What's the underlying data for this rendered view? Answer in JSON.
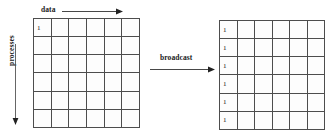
{
  "figure": {
    "axis_labels": {
      "horizontal": "data",
      "vertical": "processes"
    },
    "operation_label": "broadcast",
    "line_color": "#4d4d4d",
    "text_color": "#1a1a1a",
    "background": "#ffffff"
  },
  "chart_data": {
    "type": "table",
    "title": "broadcast",
    "xlabel": "data",
    "ylabel": "processes",
    "grids": [
      {
        "name": "source-grid",
        "rows": 6,
        "cols": 6,
        "cells": [
          [
            "1",
            "",
            "",
            "",
            "",
            ""
          ],
          [
            "",
            "",
            "",
            "",
            "",
            ""
          ],
          [
            "",
            "",
            "",
            "",
            "",
            ""
          ],
          [
            "",
            "",
            "",
            "",
            "",
            ""
          ],
          [
            "",
            "",
            "",
            "",
            "",
            ""
          ],
          [
            "",
            "",
            "",
            "",
            "",
            ""
          ]
        ]
      },
      {
        "name": "result-grid",
        "rows": 6,
        "cols": 6,
        "cells": [
          [
            "1",
            "",
            "",
            "",
            "",
            ""
          ],
          [
            "1",
            "",
            "",
            "",
            "",
            ""
          ],
          [
            "1",
            "",
            "",
            "",
            "",
            ""
          ],
          [
            "1",
            "",
            "",
            "",
            "",
            ""
          ],
          [
            "1",
            "",
            "",
            "",
            "",
            ""
          ],
          [
            "1",
            "",
            "",
            "",
            "",
            ""
          ]
        ]
      }
    ],
    "annotations": [
      {
        "text": "data",
        "direction": "right"
      },
      {
        "text": "processes",
        "direction": "down"
      },
      {
        "text": "broadcast",
        "direction": "right"
      }
    ]
  }
}
